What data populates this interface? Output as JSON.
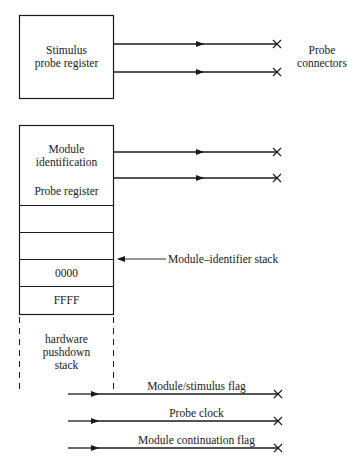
{
  "diagram": {
    "stimulus_register": {
      "line1": "Stimulus",
      "line2": "probe register"
    },
    "probe_connectors": {
      "line1": "Probe",
      "line2": "connectors"
    },
    "module_register": {
      "line1": "Module",
      "line2": "identification",
      "line3": "Probe register"
    },
    "stack_cells": [
      "",
      "",
      "0000",
      "FFFF"
    ],
    "stack_pointer_label": "Module–identifier stack",
    "hardware_stack": {
      "line1": "hardware",
      "line2": "pushdown",
      "line3": "stack"
    },
    "signals": [
      {
        "label": "Module/stimulus flag"
      },
      {
        "label": "Probe clock"
      },
      {
        "label": "Module continuation flag"
      }
    ]
  }
}
